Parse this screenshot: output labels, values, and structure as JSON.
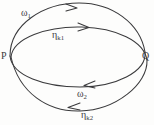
{
  "figure": {
    "background_color": "#fdfdfc",
    "stroke_color": "#3a3a3c"
  },
  "points": {
    "p": {
      "label": "P"
    },
    "q": {
      "label": "Q"
    }
  },
  "curves": {
    "omega1": {
      "label_base": "ω",
      "label_sub": "1",
      "direction": "rightward",
      "arrow_direction": "right"
    },
    "eta_k1": {
      "label_base": "η",
      "label_sub": "k1",
      "direction": "rightward",
      "arrow_direction": "right"
    },
    "omega2": {
      "label_base": "ω",
      "label_sub": "2",
      "direction": "leftward",
      "arrow_direction": "left"
    },
    "eta_k2": {
      "label_base": "η",
      "label_sub": "k2",
      "direction": "leftward",
      "arrow_direction": "left"
    }
  }
}
